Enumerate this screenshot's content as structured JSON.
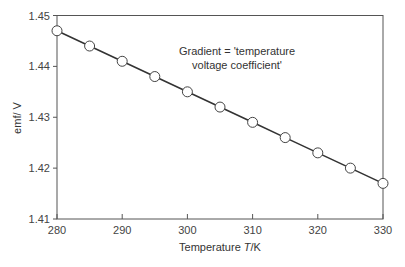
{
  "chart_data": {
    "type": "line",
    "title": "",
    "xlabel": "Temperature T/K",
    "xlabel_parts": {
      "prefix": "Temperature ",
      "var": "T",
      "suffix": "/K"
    },
    "ylabel": "emf/ V",
    "xlim": [
      280,
      330
    ],
    "ylim": [
      1.41,
      1.45
    ],
    "x_ticks": [
      280,
      290,
      300,
      310,
      320,
      330
    ],
    "x_tick_labels": [
      "280",
      "290",
      "300",
      "310",
      "320",
      "330"
    ],
    "y_ticks": [
      1.41,
      1.42,
      1.43,
      1.44,
      1.45
    ],
    "y_tick_labels": [
      "1.41",
      "1.42",
      "1.43",
      "1.44",
      "1.45"
    ],
    "grid": false,
    "legend": null,
    "annotations": [
      {
        "text_line1": "Gradient = 'temperature",
        "text_line2": "voltage coefficient'"
      }
    ],
    "series": [
      {
        "name": "emf",
        "marker": "open-circle",
        "line_color": "#333333",
        "x": [
          280,
          285,
          290,
          295,
          300,
          305,
          310,
          315,
          320,
          325,
          330
        ],
        "y": [
          1.447,
          1.444,
          1.441,
          1.438,
          1.435,
          1.432,
          1.429,
          1.426,
          1.423,
          1.42,
          1.417
        ]
      }
    ]
  }
}
